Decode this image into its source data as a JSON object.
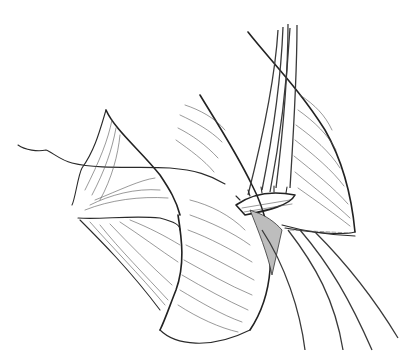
{
  "figure": {
    "panel_label": "CC",
    "colors": {
      "background": "#ffffff",
      "ink": "#2a2a2a"
    },
    "elements": {
      "sutures_top_count": 5,
      "sutures_bottom_count": 4,
      "left_thread": true
    }
  }
}
